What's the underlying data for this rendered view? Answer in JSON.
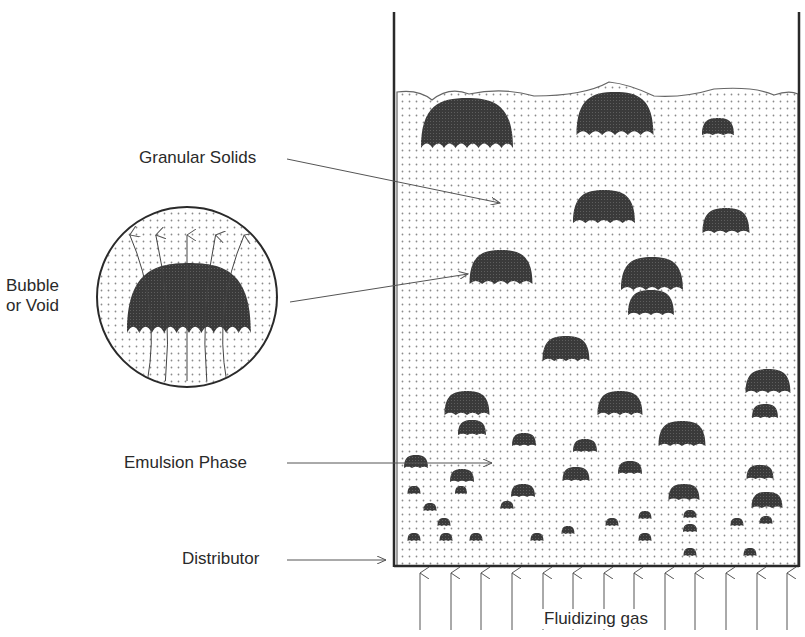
{
  "labels": {
    "granular_solids": "Granular Solids",
    "bubble_line1": "Bubble",
    "bubble_line2": "or Void",
    "emulsion_phase": "Emulsion Phase",
    "distributor": "Distributor",
    "fluidizing_gas": "Fluidizing gas"
  },
  "colors": {
    "ink": "#2a2a2a",
    "bubble": "#3a3a3a",
    "dot": "#8a8a8a",
    "background": "#ffffff"
  },
  "vessel": {
    "left": 394,
    "right": 799,
    "top": 12,
    "bottom": 566,
    "bed_surface": 92
  },
  "inset": {
    "cx": 187,
    "cy": 297,
    "r": 90
  },
  "bubbles": [
    {
      "cx": 467,
      "cy": 148,
      "w": 92,
      "h": 50
    },
    {
      "cx": 615,
      "cy": 135,
      "w": 77,
      "h": 43
    },
    {
      "cx": 718,
      "cy": 135,
      "w": 32,
      "h": 17
    },
    {
      "cx": 604,
      "cy": 223,
      "w": 62,
      "h": 33
    },
    {
      "cx": 726,
      "cy": 233,
      "w": 47,
      "h": 25
    },
    {
      "cx": 501,
      "cy": 284,
      "w": 63,
      "h": 34
    },
    {
      "cx": 652,
      "cy": 290,
      "w": 62,
      "h": 33
    },
    {
      "cx": 651,
      "cy": 315,
      "w": 46,
      "h": 25
    },
    {
      "cx": 566,
      "cy": 361,
      "w": 47,
      "h": 25
    },
    {
      "cx": 768,
      "cy": 393,
      "w": 45,
      "h": 24
    },
    {
      "cx": 467,
      "cy": 415,
      "w": 45,
      "h": 24
    },
    {
      "cx": 620,
      "cy": 415,
      "w": 45,
      "h": 24
    },
    {
      "cx": 472,
      "cy": 435,
      "w": 28,
      "h": 15
    },
    {
      "cx": 524,
      "cy": 446,
      "w": 24,
      "h": 13
    },
    {
      "cx": 682,
      "cy": 446,
      "w": 47,
      "h": 25
    },
    {
      "cx": 765,
      "cy": 418,
      "w": 26,
      "h": 14
    },
    {
      "cx": 585,
      "cy": 452,
      "w": 24,
      "h": 13
    },
    {
      "cx": 416,
      "cy": 468,
      "w": 24,
      "h": 13
    },
    {
      "cx": 462,
      "cy": 482,
      "w": 24,
      "h": 13
    },
    {
      "cx": 630,
      "cy": 474,
      "w": 24,
      "h": 13
    },
    {
      "cx": 760,
      "cy": 479,
      "w": 27,
      "h": 14
    },
    {
      "cx": 576,
      "cy": 481,
      "w": 27,
      "h": 14
    },
    {
      "cx": 523,
      "cy": 497,
      "w": 24,
      "h": 13
    },
    {
      "cx": 684,
      "cy": 500,
      "w": 31,
      "h": 16
    },
    {
      "cx": 767,
      "cy": 508,
      "w": 31,
      "h": 16
    },
    {
      "cx": 414,
      "cy": 494,
      "w": 13,
      "h": 8
    },
    {
      "cx": 461,
      "cy": 494,
      "w": 12,
      "h": 8
    },
    {
      "cx": 430,
      "cy": 511,
      "w": 13,
      "h": 8
    },
    {
      "cx": 507,
      "cy": 509,
      "w": 13,
      "h": 8
    },
    {
      "cx": 444,
      "cy": 526,
      "w": 13,
      "h": 8
    },
    {
      "cx": 645,
      "cy": 519,
      "w": 13,
      "h": 8
    },
    {
      "cx": 690,
      "cy": 518,
      "w": 13,
      "h": 8
    },
    {
      "cx": 766,
      "cy": 524,
      "w": 13,
      "h": 8
    },
    {
      "cx": 612,
      "cy": 526,
      "w": 13,
      "h": 8
    },
    {
      "cx": 737,
      "cy": 526,
      "w": 13,
      "h": 8
    },
    {
      "cx": 690,
      "cy": 532,
      "w": 14,
      "h": 8
    },
    {
      "cx": 568,
      "cy": 534,
      "w": 13,
      "h": 8
    },
    {
      "cx": 414,
      "cy": 541,
      "w": 13,
      "h": 8
    },
    {
      "cx": 446,
      "cy": 541,
      "w": 13,
      "h": 8
    },
    {
      "cx": 476,
      "cy": 541,
      "w": 13,
      "h": 8
    },
    {
      "cx": 537,
      "cy": 541,
      "w": 13,
      "h": 8
    },
    {
      "cx": 645,
      "cy": 541,
      "w": 13,
      "h": 8
    },
    {
      "cx": 690,
      "cy": 556,
      "w": 13,
      "h": 8
    },
    {
      "cx": 750,
      "cy": 556,
      "w": 13,
      "h": 8
    }
  ],
  "gas_arrows_x": [
    420,
    451,
    481,
    512,
    543,
    573,
    604,
    634,
    665,
    695,
    726,
    757,
    787
  ],
  "leaders": {
    "granular_solids": {
      "x1": 287,
      "y1": 159,
      "x2": 500,
      "y2": 203
    },
    "bubble": {
      "x1": 290,
      "y1": 302,
      "x2": 468,
      "y2": 274
    },
    "emulsion_phase": {
      "x1": 287,
      "y1": 463,
      "x2": 492,
      "y2": 463
    },
    "distributor": {
      "x1": 287,
      "y1": 560,
      "x2": 386,
      "y2": 560
    }
  }
}
